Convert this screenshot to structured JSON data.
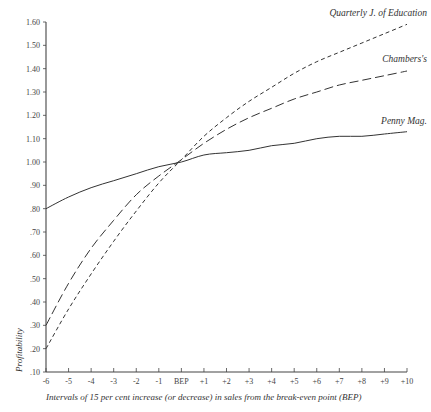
{
  "chart_data": {
    "type": "line",
    "title": "",
    "xlabel": "Intervals of 15 per cent increase (or decrease) in sales from the break-even point (BEP)",
    "ylabel": "Profitability",
    "x": [
      -6,
      -5,
      -4,
      -3,
      -2,
      -1,
      0,
      1,
      2,
      3,
      4,
      5,
      6,
      7,
      8,
      9,
      10
    ],
    "x_tick_labels": [
      "-6",
      "-5",
      "-4",
      "-3",
      "-2",
      "-1",
      "BEP",
      "+1",
      "+2",
      "+3",
      "+4",
      "+5",
      "+6",
      "+7",
      "+8",
      "+9",
      "+10"
    ],
    "y_tick_values": [
      0.1,
      0.2,
      0.3,
      0.4,
      0.5,
      0.6,
      0.7,
      0.8,
      0.9,
      1.0,
      1.1,
      1.2,
      1.3,
      1.4,
      1.5,
      1.6
    ],
    "y_tick_labels": [
      ".10",
      ".20",
      ".30",
      ".40",
      ".50",
      ".60",
      ".70",
      ".80",
      ".90",
      "1.00",
      "1.10",
      "1.20",
      "1.30",
      "1.40",
      "1.50",
      "1.60"
    ],
    "ylim": [
      0.1,
      1.6
    ],
    "xlim": [
      -6,
      10
    ],
    "grid": false,
    "legend_position": "inline labels at right end of each line",
    "series": [
      {
        "name": "Quarterly J. of Education",
        "style": "short-dash",
        "values": [
          0.2,
          0.37,
          0.52,
          0.66,
          0.79,
          0.91,
          1.01,
          1.11,
          1.19,
          1.26,
          1.32,
          1.38,
          1.43,
          1.47,
          1.51,
          1.55,
          1.59
        ]
      },
      {
        "name": "Chambers's",
        "style": "long-dash",
        "values": [
          0.3,
          0.48,
          0.63,
          0.75,
          0.86,
          0.94,
          1.01,
          1.08,
          1.14,
          1.19,
          1.23,
          1.27,
          1.3,
          1.33,
          1.35,
          1.37,
          1.39
        ]
      },
      {
        "name": "Penny Mag.",
        "style": "solid",
        "values": [
          0.8,
          0.85,
          0.89,
          0.92,
          0.95,
          0.98,
          1.0,
          1.03,
          1.04,
          1.05,
          1.07,
          1.08,
          1.1,
          1.11,
          1.11,
          1.12,
          1.13
        ]
      }
    ]
  },
  "colors": {
    "line": "#333333",
    "axis": "#444444",
    "background": "#ffffff"
  }
}
